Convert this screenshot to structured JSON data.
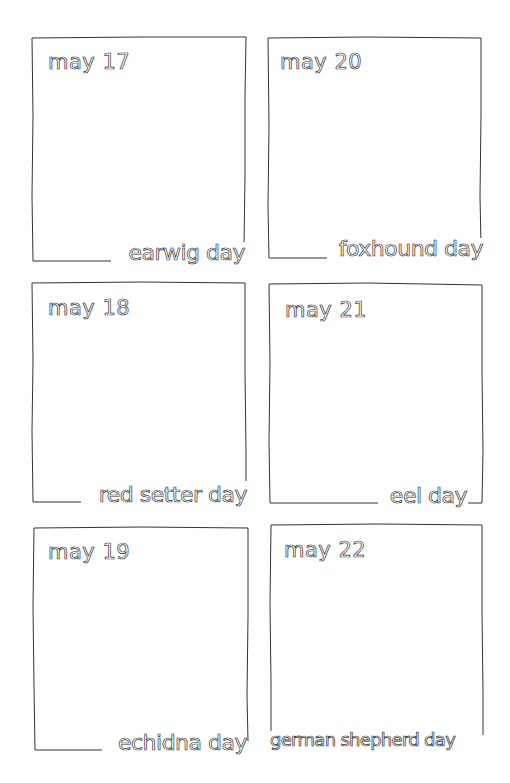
{
  "page": {
    "style": "hand-drawn calendar page with outlined lettering",
    "ink_color": "#333333",
    "paper_color": "#ffffff"
  },
  "cards": [
    {
      "date": "may 17",
      "label": "earwig day"
    },
    {
      "date": "may 20",
      "label": "foxhound day"
    },
    {
      "date": "may 18",
      "label": "red setter day"
    },
    {
      "date": "may 21",
      "label": "eel day"
    },
    {
      "date": "may 19",
      "label": "echidna day"
    },
    {
      "date": "may 22",
      "label": "german shepherd day"
    }
  ]
}
